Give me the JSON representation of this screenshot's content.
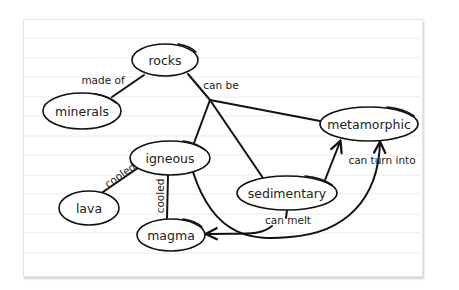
{
  "diagram": {
    "type": "concept-map",
    "nodes": {
      "rocks": {
        "label": "rocks"
      },
      "minerals": {
        "label": "minerals"
      },
      "metamorphic": {
        "label": "metamorphic"
      },
      "igneous": {
        "label": "igneous"
      },
      "sedimentary": {
        "label": "sedimentary"
      },
      "lava": {
        "label": "lava"
      },
      "magma": {
        "label": "magma"
      }
    },
    "edge_labels": {
      "made_of": "made of",
      "can_be": "can be",
      "cooled_lava": "cooled",
      "cooled_magma": "cooled",
      "can_turn_into": "can turn into",
      "can_melt": "can melt"
    },
    "edges": [
      {
        "from": "rocks",
        "to": "minerals",
        "label": "made of"
      },
      {
        "from": "rocks",
        "to": "igneous",
        "label": "can be"
      },
      {
        "from": "rocks",
        "to": "sedimentary",
        "label": "can be"
      },
      {
        "from": "rocks",
        "to": "metamorphic",
        "label": "can be"
      },
      {
        "from": "igneous",
        "to": "lava",
        "label": "cooled"
      },
      {
        "from": "igneous",
        "to": "magma",
        "label": "cooled"
      },
      {
        "from": "igneous",
        "to": "metamorphic",
        "label": "can turn into",
        "arrow": true
      },
      {
        "from": "sedimentary",
        "to": "metamorphic",
        "label": "can turn into",
        "arrow": true
      },
      {
        "from": "sedimentary",
        "to": "magma",
        "label": "can melt",
        "arrow": true
      }
    ],
    "colors": {
      "ink": "#111111",
      "paper": "#ffffff",
      "rule_lines": "#ebebeb"
    }
  }
}
